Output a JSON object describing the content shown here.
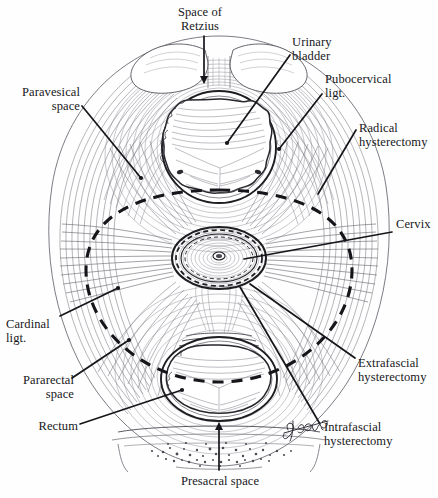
{
  "figure": {
    "type": "anatomical-illustration",
    "background_color": "#fefefe",
    "ink_color": "#17171a",
    "line_color": "#2a2a2e",
    "fiber_color": "#6f6f77",
    "signature": "George"
  },
  "labels": [
    {
      "id": "space-of-retzius",
      "text": "Space of\nRetzius",
      "align": "center",
      "x": 173,
      "y": 6
    },
    {
      "id": "urinary-bladder",
      "text": "Urinary\nbladder",
      "align": "left",
      "x": 292,
      "y": 36
    },
    {
      "id": "pubocervical-ligament",
      "text": "Pubocervical\nligt.",
      "align": "left",
      "x": 325,
      "y": 73
    },
    {
      "id": "radical-hysterectomy",
      "text": "Radical\nhysterectomy",
      "align": "left",
      "x": 359,
      "y": 122
    },
    {
      "id": "cervix",
      "text": "Cervix",
      "align": "left",
      "x": 396,
      "y": 218
    },
    {
      "id": "extrafascial-hysterectomy",
      "text": "Extrafascial\nhysterectomy",
      "align": "left",
      "x": 358,
      "y": 357
    },
    {
      "id": "intrafascial-hysterectomy",
      "text": "Intrafascial\nhysterectomy",
      "align": "left",
      "x": 324,
      "y": 421
    },
    {
      "id": "paravesical-space",
      "text": "Paravesical\nspace",
      "align": "right",
      "x": 8,
      "y": 86
    },
    {
      "id": "cardinal-ligament",
      "text": "Cardinal\nligt.",
      "align": "left",
      "x": 6,
      "y": 318
    },
    {
      "id": "pararectal-space",
      "text": "Pararectal\nspace",
      "align": "right",
      "x": 8,
      "y": 374
    },
    {
      "id": "rectum",
      "text": "Rectum",
      "align": "right",
      "x": 8,
      "y": 420
    },
    {
      "id": "presacral-space",
      "text": "Presacral space",
      "align": "center",
      "x": 160,
      "y": 475
    }
  ],
  "structures": [
    {
      "id": "urinary-bladder",
      "shape": "scalloped-oval",
      "cx": 219,
      "cy": 146
    },
    {
      "id": "cervix",
      "shape": "concentric-rings",
      "cx": 219,
      "cy": 258
    },
    {
      "id": "rectum",
      "shape": "scalloped-oval",
      "cx": 219,
      "cy": 378
    },
    {
      "id": "pubic-bone",
      "shape": "paired-lobes",
      "cx": 219,
      "cy": 62
    },
    {
      "id": "sacrum",
      "shape": "stippled-band",
      "cx": 219,
      "cy": 448
    }
  ],
  "resection_lines": [
    {
      "id": "radical-hysterectomy-line",
      "style": "dashed",
      "weight": "heavy",
      "shape": "large-ellipse"
    },
    {
      "id": "extrafascial-hysterectomy-line",
      "style": "dashed",
      "weight": "medium",
      "shape": "cervix-outer-ring"
    },
    {
      "id": "intrafascial-hysterectomy-line",
      "style": "dashed",
      "weight": "light",
      "shape": "cervix-inner-ring"
    }
  ]
}
